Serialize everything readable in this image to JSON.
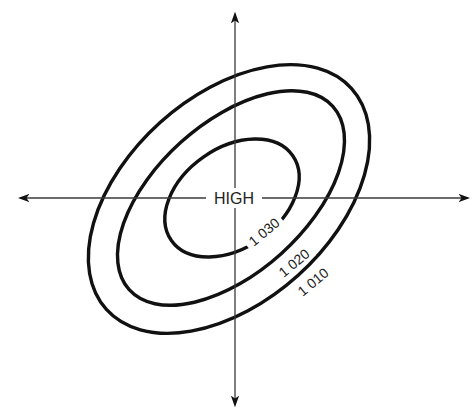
{
  "diagram": {
    "type": "isobar-pressure-system",
    "center_label": "HIGH",
    "isobars": [
      {
        "label": "1 030",
        "position": "inner"
      },
      {
        "label": "1 020",
        "position": "middle"
      },
      {
        "label": "1 010",
        "position": "outer"
      }
    ],
    "axes": {
      "horizontal": "double-headed arrow",
      "vertical": "double-headed arrow"
    },
    "colors": {
      "line": "#111111",
      "axis": "#3a3a3a",
      "background": "#ffffff"
    }
  }
}
